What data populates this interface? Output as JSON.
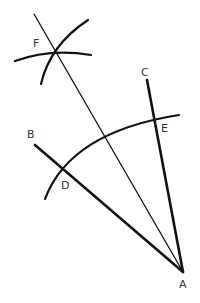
{
  "diagram": {
    "colors": {
      "stroke": "#111111",
      "label": "#333333",
      "background": "#ffffff"
    },
    "points": [
      {
        "id": "A",
        "label": "A",
        "x": 183,
        "y": 272,
        "label_x": 180,
        "label_y": 287
      },
      {
        "id": "B",
        "label": "B",
        "x": 35,
        "y": 145,
        "label_x": 27,
        "label_y": 137
      },
      {
        "id": "C",
        "label": "C",
        "x": 147,
        "y": 80,
        "label_x": 142,
        "label_y": 75
      },
      {
        "id": "D",
        "label": "D",
        "x": 64,
        "y": 171,
        "label_x": 62,
        "label_y": 188
      },
      {
        "id": "E",
        "label": "E",
        "x": 154,
        "y": 117,
        "label_x": 162,
        "label_y": 132
      },
      {
        "id": "F",
        "label": "F",
        "x": 56,
        "y": 51,
        "label_x": 33,
        "label_y": 46
      }
    ],
    "segments": [
      {
        "name": "ray-AB",
        "from": "A",
        "to": "B",
        "weight": "thick"
      },
      {
        "name": "ray-AC",
        "from": "A",
        "to": "C",
        "weight": "thick"
      },
      {
        "name": "bisector-AF",
        "from": "A",
        "to_xy": [
          34,
          14
        ],
        "weight": "thin"
      }
    ],
    "arcs": [
      {
        "name": "arc-DE",
        "description": "Arc centered at A crossing both rays at D and E"
      },
      {
        "name": "arc-from-D",
        "description": "Arc centered at D intersecting at F"
      },
      {
        "name": "arc-from-E",
        "description": "Arc centered at E intersecting at F"
      }
    ]
  }
}
